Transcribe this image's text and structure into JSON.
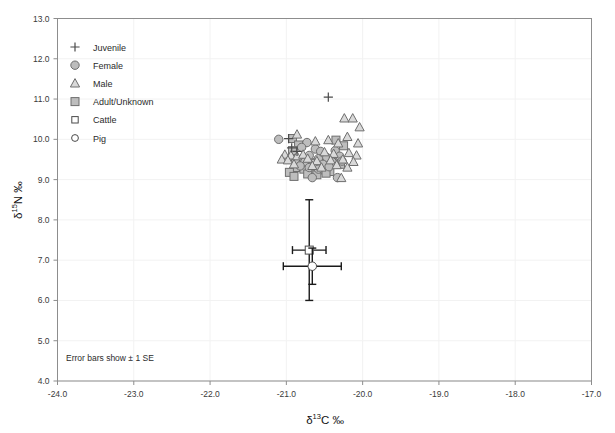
{
  "chart_data": {
    "type": "scatter",
    "title": "",
    "xlabel": "δ¹³C ‰",
    "ylabel": "δ¹⁵N ‰",
    "xlim": [
      -24.0,
      -17.0
    ],
    "ylim": [
      4.0,
      13.0
    ],
    "xticks": [
      "-24.0",
      "-23.0",
      "-22.0",
      "-21.0",
      "-20.0",
      "-19.0",
      "-18.0",
      "-17.0"
    ],
    "yticks": [
      "4.0",
      "5.0",
      "6.0",
      "7.0",
      "8.0",
      "9.0",
      "10.0",
      "11.0",
      "12.0",
      "13.0"
    ],
    "grid": true,
    "legend_position": "top-left",
    "annotation": "Error bars show ± 1 SE",
    "series": [
      {
        "name": "Juvenile",
        "marker": "plus",
        "points": [
          [
            -20.45,
            11.05
          ],
          [
            -20.97,
            10.02
          ],
          [
            -20.93,
            9.79
          ],
          [
            -20.86,
            9.7
          ]
        ]
      },
      {
        "name": "Female",
        "marker": "filled-circle",
        "points": [
          [
            -21.1,
            10.0
          ],
          [
            -20.73,
            9.92
          ],
          [
            -20.8,
            9.8
          ],
          [
            -20.62,
            9.76
          ],
          [
            -20.55,
            9.7
          ],
          [
            -20.36,
            9.72
          ],
          [
            -20.7,
            9.6
          ],
          [
            -20.58,
            9.52
          ],
          [
            -20.47,
            9.55
          ],
          [
            -20.3,
            9.58
          ],
          [
            -20.88,
            9.5
          ],
          [
            -20.76,
            9.44
          ],
          [
            -20.64,
            9.4
          ],
          [
            -20.52,
            9.38
          ],
          [
            -20.4,
            9.44
          ],
          [
            -20.27,
            9.46
          ],
          [
            -20.82,
            9.34
          ],
          [
            -20.7,
            9.3
          ],
          [
            -20.58,
            9.26
          ],
          [
            -20.44,
            9.32
          ],
          [
            -20.66,
            9.05
          ],
          [
            -20.33,
            9.05
          ]
        ]
      },
      {
        "name": "Male",
        "marker": "triangle",
        "points": [
          [
            -20.24,
            10.52
          ],
          [
            -20.13,
            10.52
          ],
          [
            -20.04,
            10.3
          ],
          [
            -20.86,
            10.12
          ],
          [
            -20.2,
            10.06
          ],
          [
            -20.62,
            9.95
          ],
          [
            -20.45,
            9.98
          ],
          [
            -20.32,
            9.9
          ],
          [
            -20.06,
            9.9
          ],
          [
            -21.02,
            9.62
          ],
          [
            -20.94,
            9.6
          ],
          [
            -20.86,
            9.58
          ],
          [
            -20.78,
            9.62
          ],
          [
            -20.5,
            9.68
          ],
          [
            -20.38,
            9.64
          ],
          [
            -20.18,
            9.66
          ],
          [
            -20.08,
            9.6
          ],
          [
            -21.06,
            9.5
          ],
          [
            -20.98,
            9.48
          ],
          [
            -20.72,
            9.52
          ],
          [
            -20.6,
            9.46
          ],
          [
            -20.42,
            9.48
          ],
          [
            -20.26,
            9.5
          ],
          [
            -20.12,
            9.44
          ],
          [
            -20.9,
            9.38
          ],
          [
            -20.66,
            9.34
          ],
          [
            -20.54,
            9.3
          ],
          [
            -20.34,
            9.36
          ],
          [
            -20.2,
            9.3
          ],
          [
            -20.28,
            9.04
          ]
        ]
      },
      {
        "name": "Adult/Unknown",
        "marker": "filled-square",
        "points": [
          [
            -20.92,
            10.02
          ],
          [
            -20.84,
            9.86
          ],
          [
            -20.92,
            9.72
          ],
          [
            -20.35,
            9.98
          ],
          [
            -20.25,
            9.84
          ],
          [
            -20.74,
            9.46
          ],
          [
            -20.63,
            9.42
          ],
          [
            -20.5,
            9.4
          ],
          [
            -20.4,
            9.42
          ],
          [
            -20.29,
            9.38
          ],
          [
            -20.88,
            9.3
          ],
          [
            -20.77,
            9.26
          ],
          [
            -20.65,
            9.22
          ],
          [
            -20.54,
            9.24
          ],
          [
            -20.43,
            9.2
          ],
          [
            -20.96,
            9.18
          ],
          [
            -20.72,
            9.14
          ],
          [
            -20.6,
            9.12
          ],
          [
            -20.48,
            9.16
          ],
          [
            -20.9,
            9.08
          ]
        ]
      },
      {
        "name": "Cattle",
        "marker": "open-square",
        "mean": [
          -20.7,
          7.25
        ],
        "x_se": 0.22,
        "y_se": 1.25,
        "points": [
          [
            -20.7,
            7.25
          ]
        ]
      },
      {
        "name": "Pig",
        "marker": "open-circle",
        "mean": [
          -20.66,
          6.85
        ],
        "x_se": 0.38,
        "y_se": 0.45,
        "points": [
          [
            -20.66,
            6.85
          ]
        ]
      }
    ]
  },
  "legend": {
    "items": [
      {
        "label": "Juvenile",
        "marker": "plus"
      },
      {
        "label": "Female",
        "marker": "filled-circle"
      },
      {
        "label": "Male",
        "marker": "triangle"
      },
      {
        "label": "Adult/Unknown",
        "marker": "filled-square"
      },
      {
        "label": "Cattle",
        "marker": "open-square"
      },
      {
        "label": "Pig",
        "marker": "open-circle"
      }
    ]
  },
  "axes": {
    "x_title_main": "C ‰",
    "x_title_delta": "δ",
    "x_title_sup": "13",
    "y_title_main": "N ‰",
    "y_title_delta": "δ",
    "y_title_sup": "15"
  },
  "note": {
    "text": "Error bars show ± 1 SE"
  },
  "colors": {
    "marker_fill": "#bdbdbd",
    "marker_stroke": "#6e6e6e",
    "triangle_fill": "#d9d9d9",
    "grid": "#f2f2f2",
    "frame": "#8d8d8d",
    "errorbar": "#1a1a1a",
    "text": "#2b2b2b"
  }
}
